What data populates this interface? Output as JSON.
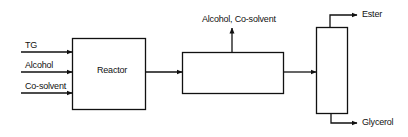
{
  "diagram": {
    "inputs": [
      "TG",
      "Alcohol",
      "Co-solvent"
    ],
    "reactor_label": "Reactor",
    "separator_output": "Alcohol, Co-solvent",
    "products": {
      "top": "Ester",
      "bottom": "Glycerol"
    }
  }
}
